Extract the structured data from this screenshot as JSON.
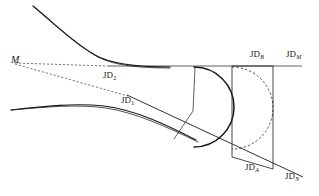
{
  "figure": {
    "kind": "engineering-alignment-geometry-diagram",
    "background_color": "#ffffff",
    "stroke_color": "#1a1a1a",
    "width": 319,
    "height": 196,
    "labels": {
      "m": "M",
      "jd1_base": "JD",
      "jd1_sub": "1",
      "jd2_base": "JD",
      "jd2_sub": "2",
      "jda_base": "JD",
      "jda_sub": "A",
      "jdb_base": "JD",
      "jdb_sub": "B",
      "jdm_base": "JD",
      "jdm_sub": "M",
      "jdn_base": "JD",
      "jdn_sub": "N"
    },
    "label_positions": {
      "m": {
        "x": 11,
        "y": 55
      },
      "jd1": {
        "x": 121,
        "y": 96
      },
      "jd2": {
        "x": 103,
        "y": 71
      },
      "jda": {
        "x": 245,
        "y": 163
      },
      "jdb": {
        "x": 250,
        "y": 50
      },
      "jdm": {
        "x": 286,
        "y": 50
      },
      "jdn": {
        "x": 285,
        "y": 172
      }
    }
  },
  "geometry": {
    "upper_spiral_curve": "M 33 6 C 55 24 74 43 95 55 C 112 65 140 67 170 67",
    "upper_spiral_curve_inner": "M 33 6 C 56 26 76 45 98 57 C 115 66 142 68 170 68",
    "lower_spiral_curve": "M 11 110 C 45 106 75 103 104 106 C 135 110 165 124 196 140",
    "lower_spiral_curve_inner": "M 11 110 C 46 107 77 104 106 108 C 137 113 167 127 198 142",
    "top_tangent_line": "M 107 66 L 302 66",
    "lower_tangent_line": "M 127 95 L 303 177",
    "m_to_jd2_dashed": "M 15 63 L 107 66",
    "m_to_jd1_dashed": "M 15 64 L 128 96",
    "solid_arc": "M 194 67 A 40 40 0 1 1 194 147",
    "dashed_arc": "M 232 67 A 41 41 0 1 1 232 149",
    "chord_left_line": "M 195 67 L 193 111 L 174 139",
    "vertical_jdb": "M 232 66 L 232 157",
    "vertical_jdm": "M 273 66 L 273 169",
    "baseline_jda_jdn": "M 232 157 L 273 169",
    "top_cap_line": "M 232 66 L 273 66"
  }
}
